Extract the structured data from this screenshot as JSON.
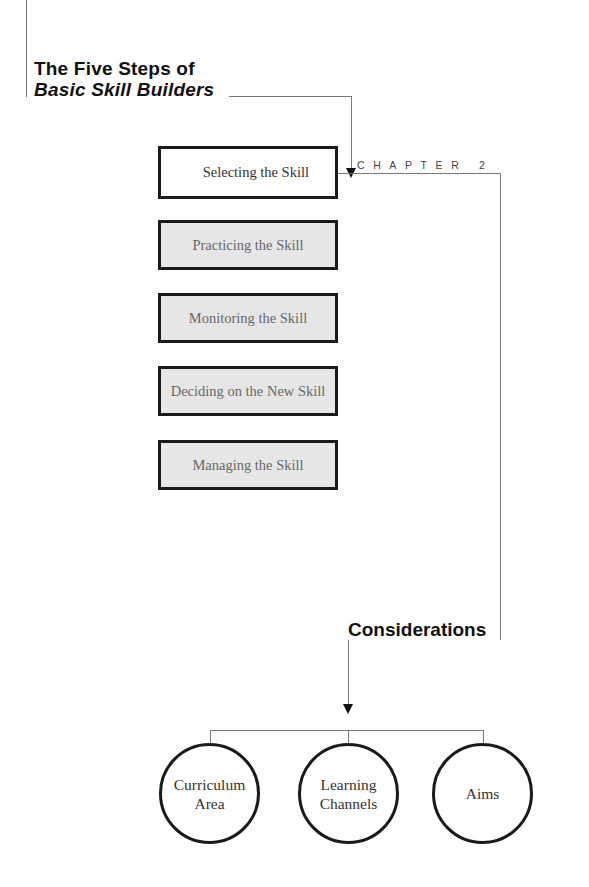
{
  "title": {
    "line1": "The Five Steps of",
    "line2": "Basic Skill Builders"
  },
  "chapter_label": "CHAPTER 2",
  "steps": [
    {
      "label": "Selecting the Skill",
      "active": true
    },
    {
      "label": "Practicing the Skill",
      "active": false
    },
    {
      "label": "Monitoring the Skill",
      "active": false
    },
    {
      "label": "Deciding on the New Skill",
      "active": false
    },
    {
      "label": "Managing the Skill",
      "active": false
    }
  ],
  "considerations": {
    "heading": "Considerations",
    "items": [
      {
        "label": "Curriculum\nArea"
      },
      {
        "label": "Learning\nChannels"
      },
      {
        "label": "Aims"
      }
    ]
  },
  "colors": {
    "active_step_bg": "#ffffff",
    "inactive_step_bg": "#e6e6e6",
    "border": "#1a1a1a",
    "connector": "#777777"
  }
}
